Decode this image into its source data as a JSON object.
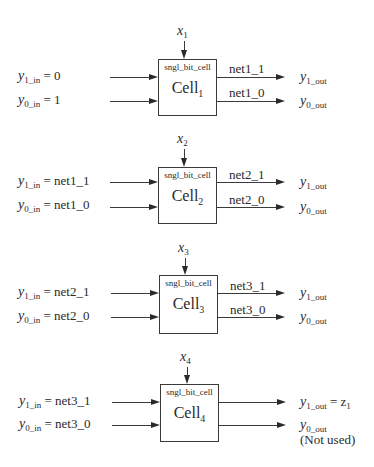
{
  "diagram": {
    "cell_type_label": "sngl_bit_cell",
    "cells": [
      {
        "name": "Cell",
        "index": "1",
        "x_var": "x",
        "x_index": "1",
        "y1_in": {
          "var": "y",
          "sub": "1_in",
          "eq": "= 0"
        },
        "y0_in": {
          "var": "y",
          "sub": "0_in",
          "eq": "= 1"
        },
        "net_1": "net1_1",
        "net_0": "net1_0",
        "y1_out": {
          "var": "y",
          "sub": "1_out",
          "eq": ""
        },
        "y0_out": {
          "var": "y",
          "sub": "0_out",
          "eq": ""
        },
        "note": ""
      },
      {
        "name": "Cell",
        "index": "2",
        "x_var": "x",
        "x_index": "2",
        "y1_in": {
          "var": "y",
          "sub": "1_in",
          "eq": "= net1_1"
        },
        "y0_in": {
          "var": "y",
          "sub": "0_in",
          "eq": "= net1_0"
        },
        "net_1": "net2_1",
        "net_0": "net2_0",
        "y1_out": {
          "var": "y",
          "sub": "1_out",
          "eq": ""
        },
        "y0_out": {
          "var": "y",
          "sub": "0_out",
          "eq": ""
        },
        "note": ""
      },
      {
        "name": "Cell",
        "index": "3",
        "x_var": "x",
        "x_index": "3",
        "y1_in": {
          "var": "y",
          "sub": "1_in",
          "eq": "= net2_1"
        },
        "y0_in": {
          "var": "y",
          "sub": "0_in",
          "eq": "= net2_0"
        },
        "net_1": "net3_1",
        "net_0": "net3_0",
        "y1_out": {
          "var": "y",
          "sub": "1_out",
          "eq": ""
        },
        "y0_out": {
          "var": "y",
          "sub": "0_out",
          "eq": ""
        },
        "note": ""
      },
      {
        "name": "Cell",
        "index": "4",
        "x_var": "x",
        "x_index": "4",
        "y1_in": {
          "var": "y",
          "sub": "1_in",
          "eq": "= net3_1"
        },
        "y0_in": {
          "var": "y",
          "sub": "0_in",
          "eq": "= net3_0"
        },
        "net_1": "",
        "net_0": "",
        "y1_out": {
          "var": "y",
          "sub": "1_out",
          "eq": "= z",
          "eq_sub": "1"
        },
        "y0_out": {
          "var": "y",
          "sub": "0_out",
          "eq": ""
        },
        "note": "(Not used)"
      }
    ]
  }
}
